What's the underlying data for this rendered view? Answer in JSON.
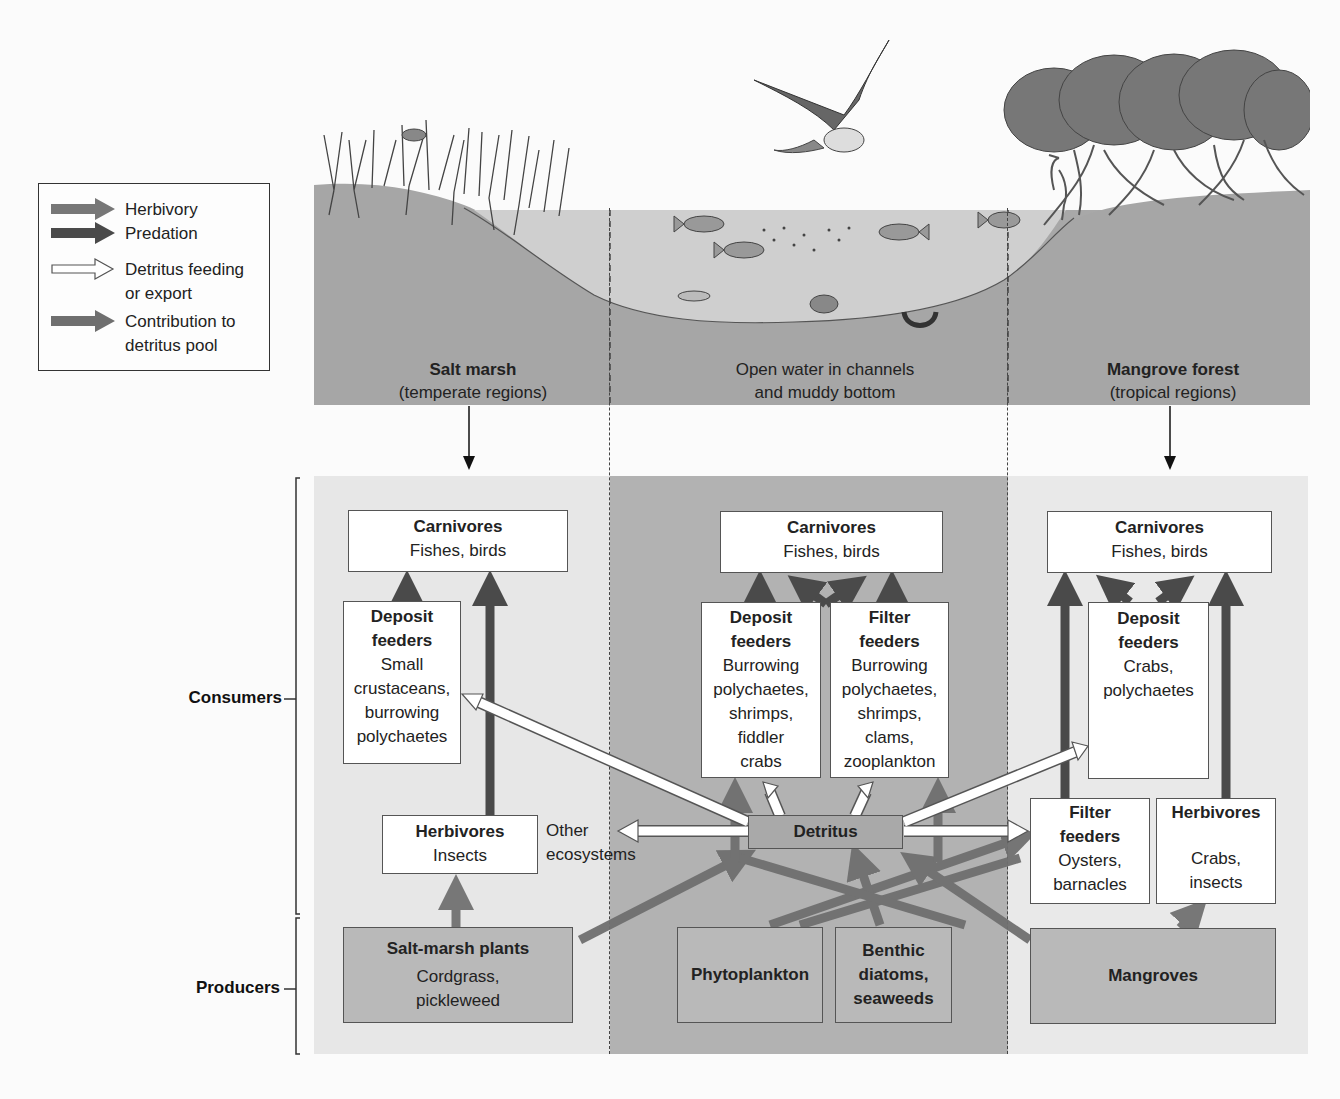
{
  "legend": {
    "items": [
      {
        "label": "Herbivory",
        "arrow": "medium-gray-solid",
        "color": "#777777"
      },
      {
        "label": "Predation",
        "arrow": "dark-gray-solid",
        "color": "#4a4a4a"
      },
      {
        "label": "Detritus feeding or export",
        "line1": "Detritus feeding",
        "line2": "or export",
        "arrow": "white-outlined",
        "color": "#ffffff"
      },
      {
        "label": "Contribution to detritus pool",
        "line1": "Contribution to",
        "line2": "detritus pool",
        "arrow": "gray-solid",
        "color": "#6f6f6f"
      }
    ]
  },
  "habitats": {
    "salt_marsh": {
      "title": "Salt marsh",
      "subtitle": "(temperate regions)"
    },
    "open_water": {
      "line1": "Open water in channels",
      "line2": "and muddy bottom"
    },
    "mangrove": {
      "title": "Mangrove forest",
      "subtitle": "(tropical regions)"
    }
  },
  "levels": {
    "consumers": "Consumers",
    "producers": "Producers"
  },
  "salt_marsh": {
    "carnivores": {
      "title": "Carnivores",
      "body": "Fishes, birds"
    },
    "deposit_feeders": {
      "title1": "Deposit",
      "title2": "feeders",
      "body": [
        "Small",
        "crustaceans,",
        "burrowing",
        "polychaetes"
      ]
    },
    "herbivores": {
      "title": "Herbivores",
      "body": "Insects"
    },
    "producers": {
      "title": "Salt-marsh plants",
      "body": [
        "Cordgrass,",
        "pickleweed"
      ]
    },
    "other_ecosystems": {
      "line1": "Other",
      "line2": "ecosystems"
    }
  },
  "open_water": {
    "carnivores": {
      "title": "Carnivores",
      "body": "Fishes, birds"
    },
    "deposit_feeders": {
      "title1": "Deposit",
      "title2": "feeders",
      "body": [
        "Burrowing",
        "polychaetes,",
        "shrimps,",
        "fiddler",
        "crabs"
      ]
    },
    "filter_feeders": {
      "title1": "Filter",
      "title2": "feeders",
      "body": [
        "Burrowing",
        "polychaetes,",
        "shrimps,",
        "clams,",
        "zooplankton"
      ]
    },
    "detritus": {
      "title": "Detritus"
    },
    "phytoplankton": {
      "title": "Phytoplankton"
    },
    "benthic": {
      "title": [
        "Benthic",
        "diatoms,",
        "seaweeds"
      ]
    }
  },
  "mangrove": {
    "carnivores": {
      "title": "Carnivores",
      "body": "Fishes, birds"
    },
    "deposit_feeders": {
      "title1": "Deposit",
      "title2": "feeders",
      "body": [
        "Crabs,",
        "polychaetes"
      ]
    },
    "filter_feeders": {
      "title1": "Filter",
      "title2": "feeders",
      "body": [
        "Oysters,",
        "barnacles"
      ]
    },
    "herbivores": {
      "title": "Herbivores",
      "body": [
        "Crabs,",
        "insects"
      ]
    },
    "producers": {
      "title": "Mangroves"
    }
  },
  "colors": {
    "predation": "#4a4a4a",
    "herbivory": "#777777",
    "detritus_contribution": "#6f6f6f",
    "detritus_feeding": "#ffffff",
    "panel_side": "#e7e7e7",
    "panel_mid": "#b2b2b2",
    "soil": "#a8a8a8",
    "water": "#cfcfcf"
  }
}
